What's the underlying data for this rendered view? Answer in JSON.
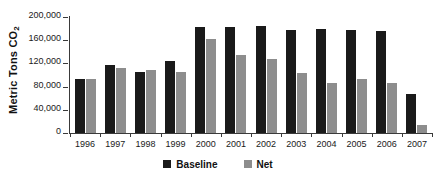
{
  "chart_data": {
    "type": "bar",
    "title": "",
    "subtitle": "",
    "xlabel": "",
    "ylabel": "Metric Tons CO2",
    "ylabel_display": "Metric Tons CO",
    "ylabel_subscript": "2",
    "categories": [
      "1996",
      "1997",
      "1998",
      "1999",
      "2000",
      "2001",
      "2002",
      "2003",
      "2004",
      "2005",
      "2006",
      "2007"
    ],
    "series": [
      {
        "name": "Baseline",
        "color": "#1a1a1a",
        "values": [
          93000,
          117000,
          106000,
          125000,
          182000,
          183000,
          185000,
          178000,
          179000,
          178000,
          176000,
          68000
        ]
      },
      {
        "name": "Net",
        "color": "#8d8d8d",
        "values": [
          93000,
          112000,
          109000,
          106000,
          162000,
          135000,
          128000,
          103000,
          87000,
          93000,
          86000,
          13000
        ]
      }
    ],
    "ylim": [
      0,
      200000
    ],
    "y_ticks": [
      0,
      40000,
      80000,
      120000,
      160000,
      200000
    ],
    "y_tick_labels": [
      "0",
      "40,000",
      "80,000",
      "120,000",
      "160,000",
      "200,000"
    ],
    "grid": false,
    "legend_position": "bottom"
  }
}
